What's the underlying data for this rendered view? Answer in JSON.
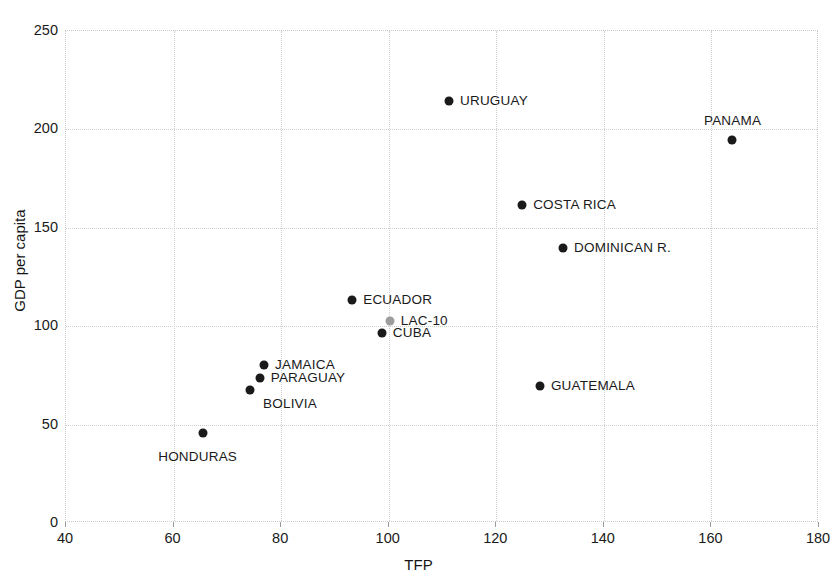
{
  "chart_data": {
    "type": "scatter",
    "title": "",
    "xlabel": "TFP",
    "ylabel": "GDP per capita",
    "xlim": [
      40,
      180
    ],
    "ylim": [
      0,
      250
    ],
    "xticks": [
      40,
      60,
      80,
      100,
      120,
      140,
      160,
      180
    ],
    "yticks": [
      0,
      50,
      100,
      150,
      200,
      250
    ],
    "grid": true,
    "legend": "none",
    "marker_colors": {
      "country": "#1a1a1a",
      "aggregate": "#9d9d9d"
    },
    "points": [
      {
        "label": "URUGUAY",
        "x": 111.4,
        "y": 214,
        "color": "#1a1a1a",
        "label_pos": "right"
      },
      {
        "label": "PANAMA",
        "x": 164.0,
        "y": 194,
        "color": "#1a1a1a",
        "label_pos": "above-right"
      },
      {
        "label": "COSTA RICA",
        "x": 125.0,
        "y": 161,
        "color": "#1a1a1a",
        "label_pos": "right"
      },
      {
        "label": "DOMINICAN R.",
        "x": 132.6,
        "y": 139,
        "color": "#1a1a1a",
        "label_pos": "right"
      },
      {
        "label": "ECUADOR",
        "x": 93.4,
        "y": 113,
        "color": "#1a1a1a",
        "label_pos": "right"
      },
      {
        "label": "LAC-10",
        "x": 100.4,
        "y": 102,
        "color": "#9d9d9d",
        "label_pos": "right"
      },
      {
        "label": "CUBA",
        "x": 98.9,
        "y": 96,
        "color": "#1a1a1a",
        "label_pos": "right"
      },
      {
        "label": "JAMAICA",
        "x": 77.0,
        "y": 80,
        "color": "#1a1a1a",
        "label_pos": "right"
      },
      {
        "label": "PARAGUAY",
        "x": 76.2,
        "y": 73,
        "color": "#1a1a1a",
        "label_pos": "right"
      },
      {
        "label": "BOLIVIA",
        "x": 74.4,
        "y": 67,
        "color": "#1a1a1a",
        "label_pos": "below-right"
      },
      {
        "label": "GUATEMALA",
        "x": 128.3,
        "y": 69,
        "color": "#1a1a1a",
        "label_pos": "right"
      },
      {
        "label": "HONDURAS",
        "x": 65.7,
        "y": 45,
        "color": "#1a1a1a",
        "label_pos": "below-left"
      }
    ]
  }
}
